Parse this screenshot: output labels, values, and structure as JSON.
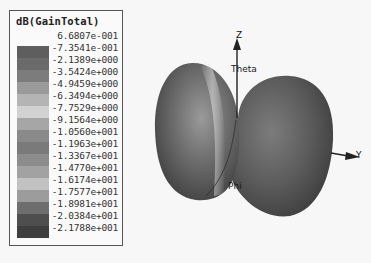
{
  "chart_data": {
    "type": "3d-radiation-pattern",
    "title": "dB(GainTotal)",
    "quantity": "dB(GainTotal)",
    "colorbar": {
      "levels": [
        "6.6807e-001",
        "-7.3541e-001",
        "-2.1389e+000",
        "-3.5424e+000",
        "-4.9459e+000",
        "-6.3494e+000",
        "-7.7529e+000",
        "-9.1564e+000",
        "-1.0560e+001",
        "-1.1963e+001",
        "-1.3367e+001",
        "-1.4770e+001",
        "-1.6174e+001",
        "-1.7577e+001",
        "-1.8981e+001",
        "-2.0384e+001",
        "-2.1788e+001"
      ],
      "values": [
        0.66807,
        -0.73541,
        -2.1389,
        -3.5424,
        -4.9459,
        -6.3494,
        -7.7529,
        -9.1564,
        -10.56,
        -11.963,
        -13.367,
        -14.77,
        -16.174,
        -17.577,
        -18.981,
        -20.384,
        -21.788
      ],
      "range": [
        -21.788,
        0.66807
      ],
      "swatch_colors": [
        "#5e5e5e",
        "#6a6a6a",
        "#7c7c7c",
        "#9a9a9a",
        "#b4b4b4",
        "#d2d2d2",
        "#a6a6a6",
        "#8a8a8a",
        "#7a7a7a",
        "#8c8c8c",
        "#a2a2a2",
        "#c2c2c2",
        "#9c9c9c",
        "#6e6e6e",
        "#4e4e4e",
        "#3e3e3e"
      ]
    },
    "axes": {
      "z_label": "Z",
      "y_label": "Y",
      "theta_label": "Theta",
      "phi_label": "Phi"
    },
    "shape": "two-lobe (dipole-like) pattern with null along Z axis"
  },
  "legend": {
    "title": "dB(GainTotal)"
  }
}
